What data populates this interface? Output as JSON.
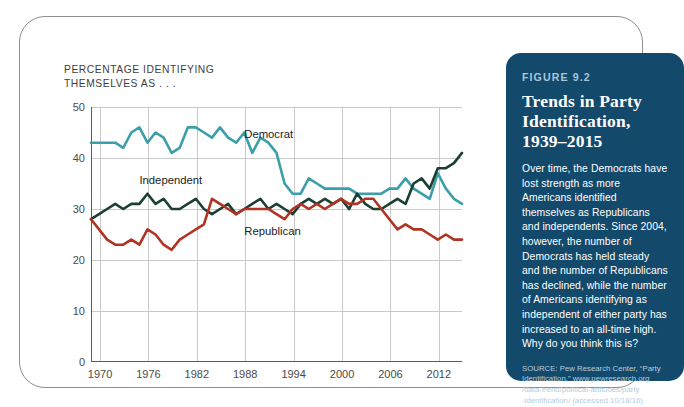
{
  "chart_panel": {
    "axis_note": "PERCENTAGE IDENTIFYING\nTHEMSELVES AS . . ."
  },
  "info_panel": {
    "figure_number": "FIGURE 9.2",
    "heading": "Trends in Party\nIdentification,\n1939–2015",
    "body": "Over time, the Democrats have lost strength as more Americans identified themselves as Republicans and independents. Since 2004, however, the number of Democrats has held steady and the number of Republicans has declined, while the number of Americans identifying as independent of either party has increased to an all-time high. Why do you think this is?",
    "source": "SOURCE: Pew Research Center, “Party\nIdentification,” www.pewresearch.org\n/data-trend/political-attitudes/party\n-identification/ (accessed 10/18/16).",
    "background_color": "#13496b",
    "label_color": "#a8c6d8"
  },
  "chart_data": {
    "type": "line",
    "title": "Trends in Party Identification, 1939–2015",
    "subtitle": "PERCENTAGE IDENTIFYING THEMSELVES AS . . .",
    "xlabel": "",
    "ylabel": "Percentage",
    "xlim": [
      1969,
      2015
    ],
    "ylim": [
      0,
      50
    ],
    "ytick_values": [
      0,
      10,
      20,
      30,
      40,
      50
    ],
    "xtick_values": [
      1970,
      1976,
      1982,
      1988,
      1994,
      2000,
      2006,
      2012
    ],
    "xtick_labels": [
      "1970",
      "1976",
      "1982",
      "1988",
      "1994",
      "2000",
      "2006",
      "2012"
    ],
    "grid": true,
    "legend": "inline-annotations",
    "annotations": [
      {
        "text": "Democrat",
        "x": 1988,
        "y": 44.5
      },
      {
        "text": "Independent",
        "x": 1975,
        "y": 35.5
      },
      {
        "text": "Republican",
        "x": 1988,
        "y": 25.5
      }
    ],
    "x": [
      1969,
      1970,
      1971,
      1972,
      1973,
      1974,
      1975,
      1976,
      1977,
      1978,
      1979,
      1980,
      1981,
      1982,
      1983,
      1984,
      1985,
      1986,
      1987,
      1988,
      1989,
      1990,
      1991,
      1992,
      1993,
      1994,
      1995,
      1996,
      1997,
      1998,
      1999,
      2000,
      2001,
      2002,
      2003,
      2004,
      2005,
      2006,
      2007,
      2008,
      2009,
      2010,
      2011,
      2012,
      2013,
      2014,
      2015
    ],
    "series": [
      {
        "name": "Democrat",
        "color": "#3a9fa8",
        "values": [
          43,
          43,
          43,
          43,
          42,
          45,
          46,
          43,
          45,
          44,
          41,
          42,
          46,
          46,
          45,
          44,
          46,
          44,
          43,
          45,
          41,
          44,
          43,
          41,
          35,
          33,
          33,
          36,
          35,
          34,
          34,
          34,
          34,
          33,
          33,
          33,
          33,
          34,
          34,
          36,
          34,
          33,
          32,
          37,
          34,
          32,
          31
        ]
      },
      {
        "name": "Independent",
        "color": "#1b3f32",
        "values": [
          28,
          29,
          30,
          31,
          30,
          31,
          31,
          33,
          31,
          32,
          30,
          30,
          31,
          32,
          30,
          29,
          30,
          31,
          29,
          30,
          31,
          32,
          30,
          31,
          30,
          29,
          31,
          32,
          31,
          32,
          31,
          32,
          30,
          33,
          31,
          30,
          30,
          31,
          32,
          31,
          35,
          36,
          34,
          38,
          38,
          39,
          41
        ]
      },
      {
        "name": "Republican",
        "color": "#b03323",
        "values": [
          28,
          26,
          24,
          23,
          23,
          24,
          23,
          26,
          25,
          23,
          22,
          24,
          25,
          26,
          27,
          32,
          31,
          30,
          29,
          30,
          30,
          30,
          30,
          29,
          28,
          30,
          31,
          30,
          31,
          30,
          31,
          32,
          31,
          31,
          32,
          32,
          30,
          28,
          26,
          27,
          26,
          26,
          25,
          24,
          25,
          24,
          24
        ]
      }
    ]
  }
}
